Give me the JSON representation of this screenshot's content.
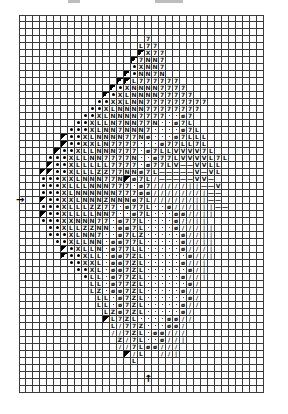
{
  "chart": {
    "grid": {
      "cols": 35,
      "rows": 54,
      "cell_px": 7,
      "origin_x": 19,
      "origin_y": 15
    },
    "legend": {
      ".": "",
      "d": "●",
      "t": "◣",
      "x": "X",
      "L": "L",
      "N": "N",
      "7": "7",
      "Z": "Z",
      "o": "ø",
      "p": "·",
      "/": "/",
      "|": "|",
      "v": "V",
      "-": "—"
    },
    "rows": [
      "...................................",
      "...................................",
      "...................................",
      "..................7................",
      ".................L77...............",
      ".................tx77..............",
      "................t7NN7..............",
      "................dxNN7..............",
      "...............tdNN7N..............",
      "..............ttL777777............",
      ".............tdxNNNN7777...........",
      "............tdxLNNNN77777..........",
      "...........ddxxLNN777777777........",
      "..........ddxLNNNN77777777.........",
      ".........ddxLNNNN7777ppo7..........",
      "........ddxLLN7NN77Nppo7L..........",
      ".......dddxLNN7NNN7ppppo7L.........",
      "......tddxLNNNN77Nopppo7LLL........",
      "......tddxxLN7777pppo77LL7L........",
      ".....tddxLLNNN777po7LLvvvv7L.......",
      "....dddxLLNN7777Nppo77LvvvvL7L.....",
      "....tddxLLLLL7777po77Lv--vvLL......",
      "...ttddxLLLZZ77NNo7L-----v-vL......",
      "...dddxxLNNN77Nto7L/-----vv-.......",
      "...dddxLLLNNN777po7/////||--v......",
      "...dddxLNNNNNN777oo///////|--......",
      "...tddxxLNNNZNNNo7L//////||--......",
      "...dddxLLLZZ77po77Lppo///|||--.....",
      "...tddxLLLLNN7ppo7Lpppoo//||.......",
      "...dddxxNNN77po77Lppppo//||........",
      "....ddxLLZZNNpoo7Lppppo///||.......",
      "....dddxLNN7ppo7LZpppppo//||.......",
      ".....ddxLLNNpoo77Lpppppo//||.......",
      "......tdxLLNpo77LLpppppo///|.......",
      "......tddxLLpoo7ZLppppppo//|.......",
      ".......ddxxLpoo7ZLpppppo//|........",
      "........ddxLpoo7ZLppppppo/|........",
      ".........dLLpo77ZLpppppo//|........",
      "..........LLpo77ZLppppppo/.........",
      "..........LZpoo7ZLpppppo//.........",
      "...........LLpo7ZLppppppo/.........",
      "...........LLpo7ZLpppppo//.........",
      "............LZo7ZLpppppo/..........",
      "............tL7ZLppppoo//..........",
      ".............L/77Zpppoo/...........",
      ".............//7ZLpoo///...........",
      "..............Z/7Lppo//|...........",
      "..............//7Loo///............",
      "...............t/L..//|............",
      "................L..................",
      "...................................",
      "...................................",
      "...................................",
      "..................................."
    ]
  },
  "markers": {
    "left_arrow": {
      "symbol": "→",
      "row": 26
    },
    "bottom_arrow": {
      "symbol": "↑",
      "col": 18
    }
  },
  "top_marks": [
    {
      "x": 68,
      "w": 12
    },
    {
      "x": 155,
      "w": 28
    }
  ]
}
